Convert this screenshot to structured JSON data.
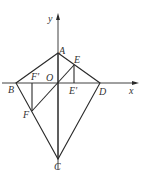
{
  "diagram": {
    "type": "geometry",
    "axes": {
      "x_label": "x",
      "y_label": "y",
      "origin_label": "O"
    },
    "points": {
      "A": {
        "label": "A",
        "x": 58,
        "y": 53
      },
      "B": {
        "label": "B",
        "x": 16,
        "y": 83
      },
      "C": {
        "label": "C",
        "x": 58,
        "y": 159
      },
      "D": {
        "label": "D",
        "x": 100,
        "y": 83
      },
      "E": {
        "label": "E",
        "x": 74,
        "y": 65
      },
      "E_prime": {
        "label": "E'",
        "x": 74,
        "y": 83
      },
      "F": {
        "label": "F",
        "x": 32,
        "y": 111
      },
      "F_prime": {
        "label": "F'",
        "x": 32,
        "y": 83
      },
      "O": {
        "label": "O",
        "x": 58,
        "y": 83
      }
    },
    "segments": [
      "AB",
      "AD",
      "BC",
      "CD",
      "AC",
      "EF",
      "EE'",
      "FF'"
    ]
  }
}
